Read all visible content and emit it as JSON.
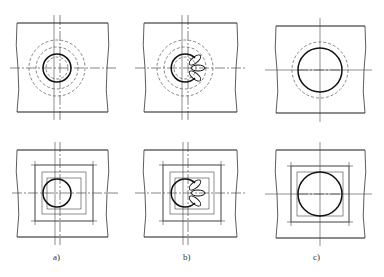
{
  "figure": {
    "panels": [
      {
        "id": "a",
        "label": "a)",
        "description": "small pilot hole with concentric dashed circles / guide squares"
      },
      {
        "id": "b",
        "label": "b)",
        "description": "partially enlarged hole with chipped lobes"
      },
      {
        "id": "c",
        "label": "c)",
        "description": "final enlarged hole"
      }
    ],
    "rows": [
      "circle-layout",
      "square-layout"
    ],
    "colors": {
      "line": "#1a1a1a",
      "background": "#ffffff"
    }
  }
}
